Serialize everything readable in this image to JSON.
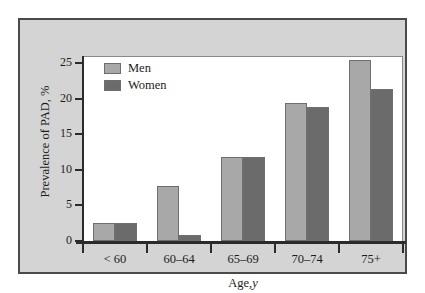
{
  "chart_data": {
    "type": "bar",
    "title": "",
    "categories": [
      "< 60",
      "60–64",
      "65–69",
      "70–74",
      "75+"
    ],
    "series": [
      {
        "name": "Men",
        "values": [
          2.5,
          7.7,
          11.8,
          19.4,
          25.4
        ],
        "color": "#a8a8a8"
      },
      {
        "name": "Women",
        "values": [
          2.5,
          0.8,
          11.8,
          18.8,
          21.3
        ],
        "color": "#6b6b6b"
      }
    ],
    "xlabel": "Age, y",
    "xlabel_plain": "Age,",
    "xlabel_italic": "y",
    "ylabel": "Prevalence of PAD, %",
    "ylim": [
      0,
      26
    ],
    "yticks": [
      0,
      5,
      10,
      15,
      20,
      25
    ],
    "ytick_labels": [
      "0",
      "5",
      "10",
      "15",
      "20",
      "25"
    ],
    "grid": false,
    "legend_position": "upper left"
  },
  "figure": {
    "panel_background": "#d4d4d4",
    "plot_background": "#ffffff",
    "border_color": "#4a4a4a",
    "axis_color": "#2b2b2b"
  },
  "legend": {
    "items": [
      {
        "label": "Men",
        "color": "#a8a8a8"
      },
      {
        "label": "Women",
        "color": "#6b6b6b"
      }
    ]
  }
}
